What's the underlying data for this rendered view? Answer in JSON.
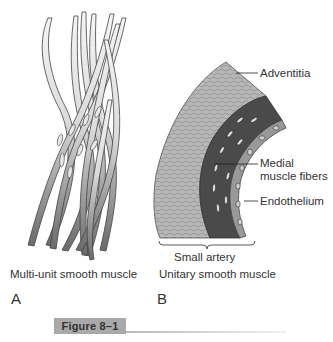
{
  "figure": {
    "label": "Figure 8–1",
    "panels": [
      {
        "letter": "A",
        "caption": "Multi-unit smooth muscle"
      },
      {
        "letter": "B",
        "caption": "Unitary smooth muscle",
        "structure_label": "Small artery",
        "annotations": {
          "adventitia": "Adventitia",
          "medial_line1": "Medial",
          "medial_line2": "muscle fibers",
          "endothelium": "Endothelium"
        }
      }
    ]
  },
  "colors": {
    "fiber_light": "#f0f0f0",
    "fiber_dark": "#6e6e6e",
    "adventitia": "#b4b4b4",
    "media": "#4a4a4a",
    "endothelium": "#8c8c8c",
    "label_bar": "#a9a9a9"
  }
}
